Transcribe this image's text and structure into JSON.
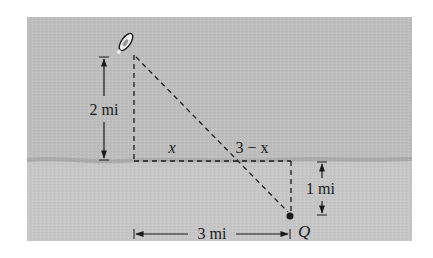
{
  "figure": {
    "labels": {
      "vertical_boat": "2 mi",
      "segment_x": "x",
      "segment_three_minus_x": "3 − x",
      "vertical_q": "1 mi",
      "horizontal_total": "3 mi",
      "point_q": "Q"
    },
    "colors": {
      "water": "#bdbdbd",
      "land": "#c6c6c6",
      "shoreline": "#a9a9a9",
      "ink": "#1a1a1a",
      "background": "#ffffff"
    },
    "icons": {
      "boat": "boat-icon",
      "point": "point-marker"
    }
  }
}
